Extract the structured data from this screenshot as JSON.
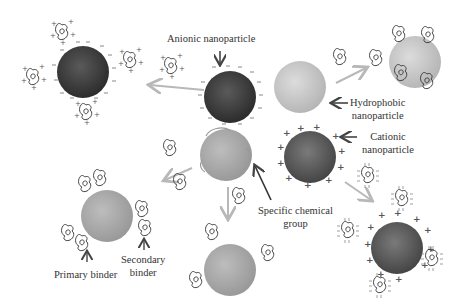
{
  "labels": {
    "anionic": "Anionic nanoparticle",
    "hydrophobic_line1": "Hydrophobic",
    "hydrophobic_line2": "nanoparticle",
    "cationic_line1": "Cationic",
    "cationic_line2": "nanoparticle",
    "specific_line1": "Specific chemical",
    "specific_line2": "group",
    "primary": "Primary binder",
    "secondary_line1": "Secondary",
    "secondary_line2": "binder"
  },
  "colors": {
    "anionic": "#3f3f3f",
    "cationic": "#5e5e5e",
    "hydrophobic": "#c6c6c6",
    "specific": "#a9a9a9",
    "arrow_gray": "#b8b8b8",
    "arrow_dark": "#444444",
    "text": "#333333"
  },
  "particles": [
    {
      "id": "anionic-center",
      "cx": 230,
      "cy": 97,
      "r": 26,
      "type": "anionic"
    },
    {
      "id": "anionic-bound",
      "cx": 83,
      "cy": 72,
      "r": 26,
      "type": "anionic"
    },
    {
      "id": "hydrophobic-center",
      "cx": 300,
      "cy": 87,
      "r": 26,
      "type": "hydrophobic"
    },
    {
      "id": "hydrophobic-bound",
      "cx": 415,
      "cy": 62,
      "r": 26,
      "type": "hydrophobic"
    },
    {
      "id": "cationic-center",
      "cx": 310,
      "cy": 157,
      "r": 26,
      "type": "cationic"
    },
    {
      "id": "cationic-bound",
      "cx": 397,
      "cy": 248,
      "r": 26,
      "type": "cationic"
    },
    {
      "id": "specific-center",
      "cx": 226,
      "cy": 155,
      "r": 26,
      "type": "specific"
    },
    {
      "id": "specific-bound-bottom",
      "cx": 230,
      "cy": 270,
      "r": 26,
      "type": "specific"
    },
    {
      "id": "specific-bound-left",
      "cx": 107,
      "cy": 216,
      "r": 26,
      "type": "specific"
    }
  ]
}
